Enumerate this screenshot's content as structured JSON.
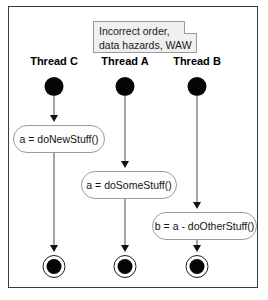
{
  "diagram": {
    "note": {
      "text": "Incorrect order,\ndata hazards, WAW"
    },
    "threads": [
      {
        "id": "thread-c",
        "label": "Thread C",
        "x": 53
      },
      {
        "id": "thread-a",
        "label": "Thread A",
        "x": 124
      },
      {
        "id": "thread-b",
        "label": "Thread B",
        "x": 196
      }
    ],
    "actions": [
      {
        "id": "action-new-stuff",
        "label": "a = doNewStuff()",
        "left": 11,
        "top": 125,
        "width": 92
      },
      {
        "id": "action-some-stuff",
        "label": "a = doSomeStuff()",
        "left": 80,
        "top": 171,
        "width": 96
      },
      {
        "id": "action-other-stuff",
        "label": "b = a - doOtherStuff()",
        "left": 151,
        "top": 212,
        "width": 104
      }
    ],
    "start_nodes": [
      {
        "id": "start-thread-c",
        "x": 53,
        "y": 76
      },
      {
        "id": "start-thread-a",
        "x": 124,
        "y": 76
      },
      {
        "id": "start-thread-b",
        "x": 196,
        "y": 76
      }
    ],
    "end_nodes": [
      {
        "id": "end-thread-c",
        "x": 53,
        "y": 256
      },
      {
        "id": "end-thread-a",
        "x": 124,
        "y": 256
      },
      {
        "id": "end-thread-b",
        "x": 196,
        "y": 256
      }
    ],
    "edges": [
      {
        "id": "edge-start-c-to-new-stuff",
        "x": 53,
        "top": 95,
        "height": 23
      },
      {
        "id": "edge-new-stuff-to-end-c",
        "x": 53,
        "top": 153,
        "height": 96
      },
      {
        "id": "edge-start-a-to-some-stuff",
        "x": 124,
        "top": 95,
        "height": 69
      },
      {
        "id": "edge-some-stuff-to-end-a",
        "x": 124,
        "top": 199,
        "height": 50
      },
      {
        "id": "edge-start-b-to-other-stuff",
        "x": 196,
        "top": 95,
        "height": 110
      },
      {
        "id": "edge-other-stuff-to-end-b",
        "x": 196,
        "top": 240,
        "height": 9
      }
    ],
    "colors": {
      "frame_border": "#3a3a3a",
      "note_fill": "#efefef",
      "note_border": "#9a9a9a",
      "action_border": "#9c9c9c",
      "node_fill": "#050505",
      "edge": "#4b4b4b"
    }
  }
}
